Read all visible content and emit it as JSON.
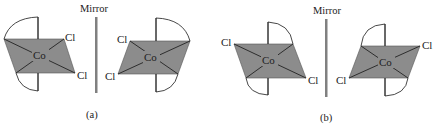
{
  "figure": {
    "colors": {
      "plane_fill": "#8c8c8c",
      "mirror_line": "#808080",
      "stroke": "#333333",
      "arc_fill": "#ffffff"
    },
    "panels": [
      {
        "caption": "(a)",
        "mirror_label": "Mirror",
        "left_molecule": {
          "center_atom": "Co",
          "ligands": [
            "Cl",
            "Cl"
          ],
          "ligand_label_upper": "Cl",
          "ligand_label_lower": "Cl"
        },
        "right_molecule": {
          "center_atom": "Co",
          "ligands": [
            "Cl",
            "Cl"
          ],
          "ligand_label_upper": "Cl",
          "ligand_label_lower": "Cl"
        }
      },
      {
        "caption": "(b)",
        "mirror_label": "Mirror",
        "left_molecule": {
          "center_atom": "Co",
          "ligands": [
            "Cl",
            "Cl"
          ],
          "ligand_label_upper": "Cl",
          "ligand_label_lower": "Cl"
        },
        "right_molecule": {
          "center_atom": "Co",
          "ligands": [
            "Cl",
            "Cl"
          ],
          "ligand_label_upper": "Cl",
          "ligand_label_lower": "Cl"
        }
      }
    ]
  }
}
